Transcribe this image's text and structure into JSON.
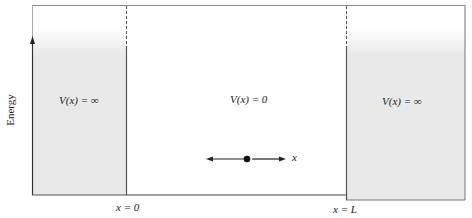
{
  "diagram": {
    "y_axis_label": "Energy",
    "regions": [
      {
        "id": "left",
        "label": "V(x) = ∞"
      },
      {
        "id": "center",
        "label": "V(x) = 0"
      },
      {
        "id": "right",
        "label": "V(x) = ∞"
      }
    ],
    "boundaries": [
      {
        "label": "x = 0"
      },
      {
        "label": "x = L"
      }
    ],
    "particle_axis_label": "x",
    "colors": {
      "wall_fill": "#e9e9ea",
      "line": "#555555",
      "border": "#8a8a8a"
    }
  }
}
